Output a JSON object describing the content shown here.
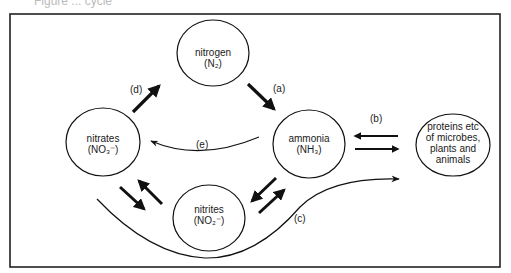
{
  "caption_fragment": "Figure ... cycle",
  "nodes": {
    "nitrogen": {
      "name": "nitrogen",
      "formula": "(N₂)"
    },
    "ammonia": {
      "name": "ammonia",
      "formula": "(NH₃)"
    },
    "nitrates": {
      "name": "nitrates",
      "formula": "(NO₃⁻)"
    },
    "nitrites": {
      "name": "nitrites",
      "formula": "(NO₂⁻)"
    },
    "proteins": {
      "line1": "proteins etc",
      "line2": "of microbes,",
      "line3": "plants and",
      "line4": "animals"
    }
  },
  "edges": {
    "a": {
      "label": "(a)",
      "from": "nitrogen",
      "to": "ammonia"
    },
    "b": {
      "label": "(b)",
      "from": "ammonia",
      "to": "proteins",
      "bidirectional": true
    },
    "c": {
      "label": "(c)",
      "from": "nitrates",
      "to": "proteins"
    },
    "d": {
      "label": "(d)",
      "from": "nitrates",
      "to": "nitrogen"
    },
    "e": {
      "label": "(e)",
      "from": "ammonia",
      "to": "nitrates"
    }
  },
  "colors": {
    "stroke": "#111111",
    "frame": "#222222",
    "background": "#ffffff"
  }
}
